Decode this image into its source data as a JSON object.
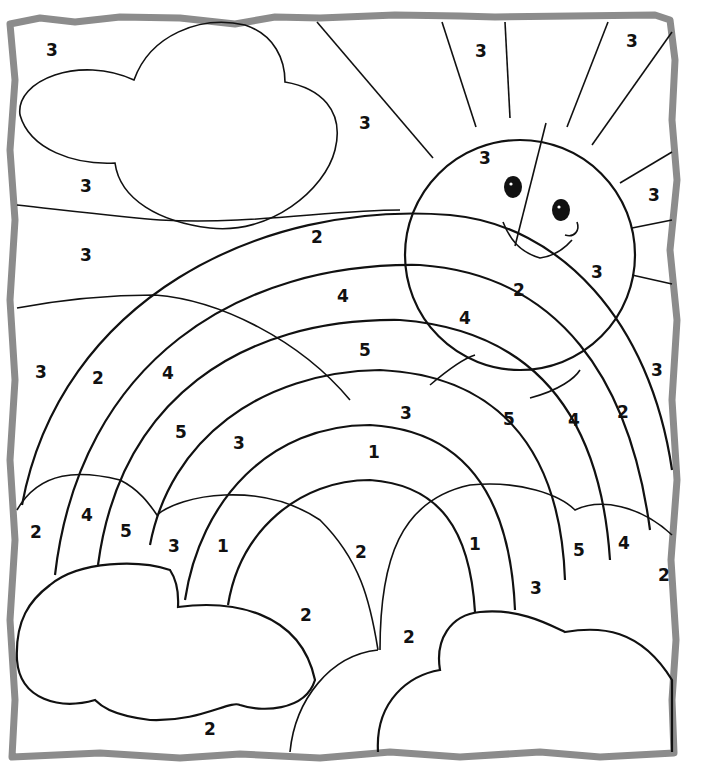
{
  "page": {
    "type": "color-by-number coloring page",
    "frame_color": "#8c8c8c",
    "line_color": "#111111",
    "background": "#ffffff"
  },
  "numbers": [
    {
      "id": "sky-top-left",
      "label": "3",
      "x": 52,
      "y": 50
    },
    {
      "id": "sky-left-under-cloud",
      "label": "3",
      "x": 86,
      "y": 186
    },
    {
      "id": "sky-left-mid",
      "label": "3",
      "x": 86,
      "y": 255
    },
    {
      "id": "sky-left-lower",
      "label": "3",
      "x": 41,
      "y": 372
    },
    {
      "id": "sky-center-top",
      "label": "3",
      "x": 365,
      "y": 123
    },
    {
      "id": "ray-top-1",
      "label": "3",
      "x": 481,
      "y": 51
    },
    {
      "id": "ray-top-2",
      "label": "3",
      "x": 632,
      "y": 41
    },
    {
      "id": "ray-right-1",
      "label": "3",
      "x": 654,
      "y": 195
    },
    {
      "id": "ray-right-2",
      "label": "3",
      "x": 597,
      "y": 272
    },
    {
      "id": "sky-right",
      "label": "3",
      "x": 657,
      "y": 370
    },
    {
      "id": "sun-left",
      "label": "3",
      "x": 485,
      "y": 158
    },
    {
      "id": "band-red-top",
      "label": "2",
      "x": 317,
      "y": 237
    },
    {
      "id": "band-red-sun",
      "label": "2",
      "x": 519,
      "y": 290
    },
    {
      "id": "band-orange-top",
      "label": "4",
      "x": 343,
      "y": 296
    },
    {
      "id": "band-orange-sun",
      "label": "4",
      "x": 465,
      "y": 318
    },
    {
      "id": "band-yellow-top",
      "label": "5",
      "x": 365,
      "y": 350
    },
    {
      "id": "band-red-left",
      "label": "2",
      "x": 98,
      "y": 378
    },
    {
      "id": "band-orange-left",
      "label": "4",
      "x": 168,
      "y": 373
    },
    {
      "id": "band-yellow-left",
      "label": "5",
      "x": 181,
      "y": 432
    },
    {
      "id": "band-green-left",
      "label": "3",
      "x": 239,
      "y": 443
    },
    {
      "id": "band-green-top",
      "label": "3",
      "x": 406,
      "y": 413
    },
    {
      "id": "band-yellow-right",
      "label": "5",
      "x": 509,
      "y": 419
    },
    {
      "id": "band-orange-right",
      "label": "4",
      "x": 574,
      "y": 420
    },
    {
      "id": "band-red-right",
      "label": "2",
      "x": 623,
      "y": 412
    },
    {
      "id": "band-blue-top",
      "label": "1",
      "x": 374,
      "y": 452
    },
    {
      "id": "hill-left-red",
      "label": "2",
      "x": 36,
      "y": 532
    },
    {
      "id": "hill-left-orange",
      "label": "4",
      "x": 87,
      "y": 515
    },
    {
      "id": "hill-left-yellow",
      "label": "5",
      "x": 126,
      "y": 531
    },
    {
      "id": "hill-left-green",
      "label": "3",
      "x": 174,
      "y": 546
    },
    {
      "id": "hill-left-blue",
      "label": "1",
      "x": 223,
      "y": 546
    },
    {
      "id": "center-red",
      "label": "2",
      "x": 361,
      "y": 552
    },
    {
      "id": "hill-right-blue",
      "label": "1",
      "x": 475,
      "y": 544
    },
    {
      "id": "hill-right-green",
      "label": "3",
      "x": 536,
      "y": 588
    },
    {
      "id": "hill-right-yellow",
      "label": "5",
      "x": 579,
      "y": 550
    },
    {
      "id": "hill-right-orange",
      "label": "4",
      "x": 624,
      "y": 543
    },
    {
      "id": "hill-right-red",
      "label": "2",
      "x": 664,
      "y": 575
    },
    {
      "id": "ground-center-left",
      "label": "2",
      "x": 306,
      "y": 615
    },
    {
      "id": "ground-center-right",
      "label": "2",
      "x": 409,
      "y": 637
    },
    {
      "id": "ground-bottom",
      "label": "2",
      "x": 210,
      "y": 729
    }
  ]
}
